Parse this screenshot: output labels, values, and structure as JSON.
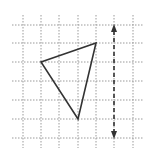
{
  "diagram": {
    "type": "grid-reflection",
    "grid": {
      "x_lines": [
        23,
        41,
        59,
        78,
        96,
        114,
        133
      ],
      "y_lines": [
        25,
        43,
        62,
        81,
        100,
        119,
        138
      ],
      "x_extent": [
        12,
        143
      ],
      "y_extent": [
        15,
        148
      ],
      "line_color": "#9a9a9a"
    },
    "triangle": {
      "vertices": [
        [
          41,
          62
        ],
        [
          96,
          43
        ],
        [
          78,
          119
        ]
      ],
      "stroke": "#333333"
    },
    "mirror_line": {
      "x": 114,
      "y_start": 25,
      "y_end": 138,
      "style": "dashed",
      "arrows": "both",
      "stroke": "#333333"
    }
  }
}
